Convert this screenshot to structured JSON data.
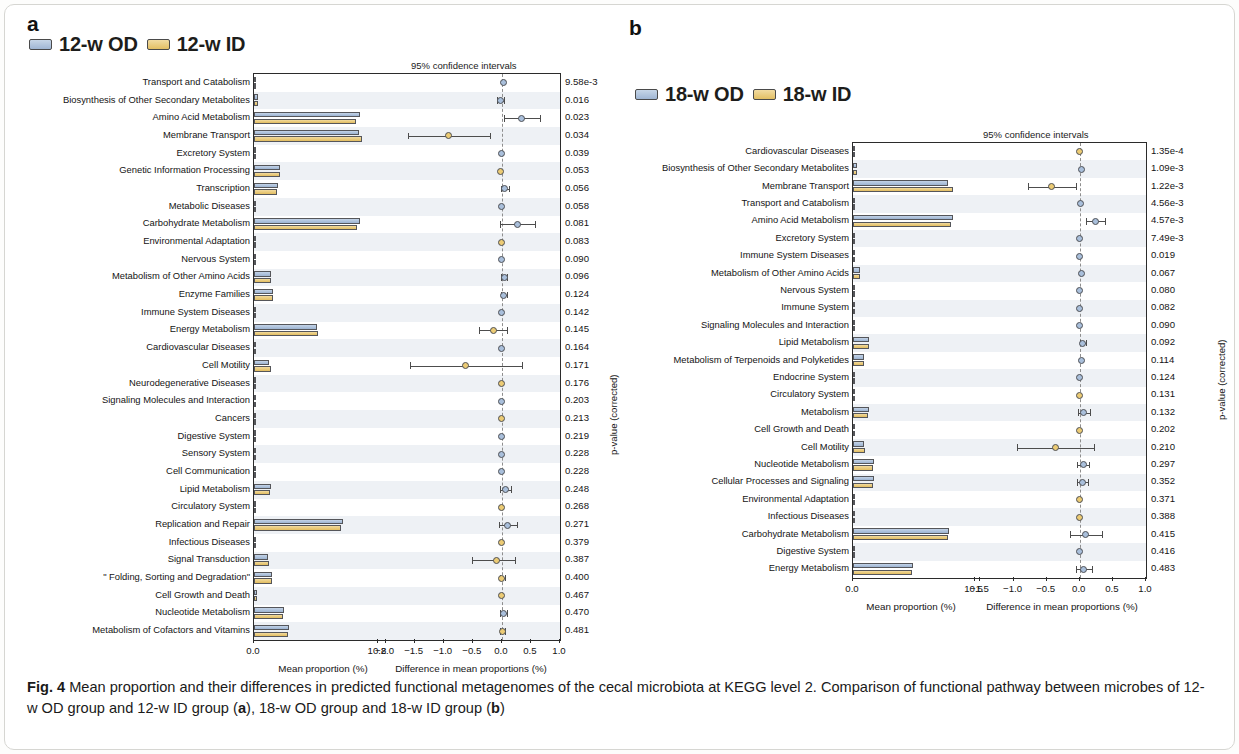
{
  "figure": {
    "caption_label": "Fig. 4",
    "caption_text": " Mean proportion and their differences in predicted functional metagenomes of the cecal microbiota at KEGG level 2. Comparison of functional pathway between microbes of 12-w OD group and 12-w ID group (",
    "caption_a": "a",
    "caption_mid": "), 18-w OD group and 18-w ID group (",
    "caption_b": "b",
    "caption_end": ")"
  },
  "colors": {
    "od_fill": "#a9bfdb",
    "id_fill": "#eccb74",
    "outline": "#4e5055",
    "band": "#eef1f5"
  },
  "panel_a": {
    "letter": "a",
    "legend": [
      {
        "name": "12-w OD",
        "color": "#a9bfdb"
      },
      {
        "name": "12-w ID",
        "color": "#eccb74"
      }
    ],
    "ci_title": "95% confidence intervals",
    "left_axis_title": "Mean proportion (%)",
    "right_axis_title": "Difference in mean proportions (%)",
    "pvalue_axis_title": "p-value (corrected)",
    "left_ticks": [
      "0.0",
      "10.8"
    ],
    "right_ticks": [
      "-2.0",
      "-1.5",
      "-1.0",
      "-0.5",
      "0.0",
      "0.5",
      "1.0"
    ]
  },
  "panel_b": {
    "letter": "b",
    "legend": [
      {
        "name": "18-w OD",
        "color": "#a9bfdb"
      },
      {
        "name": "18-w ID",
        "color": "#eccb74"
      }
    ],
    "ci_title": "95% confidence intervals",
    "left_axis_title": "Mean proportion (%)",
    "right_axis_title": "Difference in mean proportions (%)",
    "pvalue_axis_title": "p-value (corrected)",
    "left_ticks": [
      "0.0",
      "10.5"
    ],
    "right_ticks": [
      "-1.5",
      "-1.0",
      "-0.5",
      "0.0",
      "0.5",
      "1.0"
    ]
  },
  "chart_data": [
    {
      "type": "bar",
      "id": "panel_a",
      "title": "12-w OD vs 12-w ID",
      "subtitle": "95% confidence intervals",
      "xlabel": "Mean proportion (%)",
      "xlabel2": "Difference in mean proportions (%)",
      "ylabel": "",
      "rlabel": "p-value (corrected)",
      "xlim": [
        0,
        10.8
      ],
      "xlim2": [
        -2.0,
        1.0
      ],
      "grid": false,
      "legend": [
        "12-w OD",
        "12-w ID"
      ],
      "legend_position": "top-left",
      "categories": [
        "Transport and Catabolism",
        "Biosynthesis of Other Secondary Metabolites",
        "Amino Acid Metabolism",
        "Membrane Transport",
        "Excretory System",
        "Genetic Information Processing",
        "Transcription",
        "Metabolic Diseases",
        "Carbohydrate Metabolism",
        "Environmental Adaptation",
        "Nervous System",
        "Metabolism of Other Amino Acids",
        "Enzyme Families",
        "Immune System Diseases",
        "Energy Metabolism",
        "Cardiovascular Diseases",
        "Cell Motility",
        "Neurodegenerative Diseases",
        "Signaling Molecules and Interaction",
        "Cancers",
        "Digestive System",
        "Sensory System",
        "Cell Communication",
        "Lipid Metabolism",
        "Circulatory System",
        "Replication and Repair",
        "Infectious Diseases",
        "Signal Transduction",
        "\" Folding, Sorting and Degradation\"",
        "Cell Growth and Death",
        "Nucleotide Metabolism",
        "Metabolism of Cofactors and Vitamins"
      ],
      "series": [
        {
          "name": "12-w OD",
          "values": [
            0.14,
            0.32,
            9.22,
            9.12,
            0.03,
            2.28,
            2.06,
            0.02,
            9.25,
            0.05,
            0.03,
            1.52,
            1.64,
            0.02,
            5.45,
            0.02,
            1.28,
            0.04,
            0.03,
            0.02,
            0.03,
            0.01,
            0.02,
            1.44,
            0.02,
            7.72,
            0.16,
            1.18,
            1.6,
            0.24,
            2.6,
            3.02
          ]
        },
        {
          "name": "12-w ID",
          "values": [
            0.13,
            0.35,
            8.88,
            9.42,
            0.03,
            2.3,
            2.01,
            0.02,
            8.98,
            0.05,
            0.03,
            1.48,
            1.62,
            0.02,
            5.6,
            0.02,
            1.48,
            0.04,
            0.03,
            0.02,
            0.03,
            0.01,
            0.02,
            1.4,
            0.02,
            7.62,
            0.17,
            1.27,
            1.59,
            0.25,
            2.55,
            3.0
          ]
        }
      ],
      "effects": [
        {
          "diff": 0.02,
          "lo": -0.01,
          "hi": 0.05,
          "group": "od",
          "p": "9.58e-3"
        },
        {
          "diff": -0.03,
          "lo": -0.09,
          "hi": 0.03,
          "group": "od",
          "p": "0.016"
        },
        {
          "diff": 0.34,
          "lo": 0.04,
          "hi": 0.66,
          "group": "od",
          "p": "0.023"
        },
        {
          "diff": -0.92,
          "lo": -1.62,
          "hi": -0.2,
          "group": "id",
          "p": "0.034"
        },
        {
          "diff": 0.0,
          "lo": -0.01,
          "hi": 0.01,
          "group": "od",
          "p": "0.039"
        },
        {
          "diff": -0.02,
          "lo": -0.04,
          "hi": 0.01,
          "group": "id",
          "p": "0.053"
        },
        {
          "diff": 0.05,
          "lo": -0.02,
          "hi": 0.12,
          "group": "od",
          "p": "0.056"
        },
        {
          "diff": 0.0,
          "lo": -0.01,
          "hi": 0.01,
          "group": "od",
          "p": "0.058"
        },
        {
          "diff": 0.27,
          "lo": -0.03,
          "hi": 0.57,
          "group": "od",
          "p": "0.081"
        },
        {
          "diff": -0.01,
          "lo": -0.02,
          "hi": 0.01,
          "group": "id",
          "p": "0.083"
        },
        {
          "diff": 0.0,
          "lo": -0.01,
          "hi": 0.01,
          "group": "od",
          "p": "0.090"
        },
        {
          "diff": 0.04,
          "lo": -0.01,
          "hi": 0.09,
          "group": "od",
          "p": "0.096"
        },
        {
          "diff": 0.03,
          "lo": -0.02,
          "hi": 0.08,
          "group": "od",
          "p": "0.124"
        },
        {
          "diff": 0.0,
          "lo": -0.01,
          "hi": 0.01,
          "group": "od",
          "p": "0.142"
        },
        {
          "diff": -0.15,
          "lo": -0.4,
          "hi": 0.08,
          "group": "id",
          "p": "0.145"
        },
        {
          "diff": 0.0,
          "lo": -0.01,
          "hi": 0.01,
          "group": "od",
          "p": "0.164"
        },
        {
          "diff": -0.62,
          "lo": -1.58,
          "hi": 0.35,
          "group": "id",
          "p": "0.171"
        },
        {
          "diff": -0.01,
          "lo": -0.02,
          "hi": 0.0,
          "group": "id",
          "p": "0.176"
        },
        {
          "diff": 0.0,
          "lo": -0.01,
          "hi": 0.01,
          "group": "od",
          "p": "0.203"
        },
        {
          "diff": 0.0,
          "lo": -0.01,
          "hi": 0.01,
          "group": "id",
          "p": "0.213"
        },
        {
          "diff": 0.0,
          "lo": -0.01,
          "hi": 0.01,
          "group": "od",
          "p": "0.219"
        },
        {
          "diff": 0.0,
          "lo": -0.01,
          "hi": 0.01,
          "group": "od",
          "p": "0.228"
        },
        {
          "diff": 0.0,
          "lo": -0.01,
          "hi": 0.01,
          "group": "od",
          "p": "0.228"
        },
        {
          "diff": 0.06,
          "lo": -0.04,
          "hi": 0.16,
          "group": "od",
          "p": "0.248"
        },
        {
          "diff": 0.0,
          "lo": -0.01,
          "hi": 0.01,
          "group": "id",
          "p": "0.268"
        },
        {
          "diff": 0.1,
          "lo": -0.05,
          "hi": 0.26,
          "group": "od",
          "p": "0.271"
        },
        {
          "diff": 0.0,
          "lo": -0.01,
          "hi": 0.01,
          "group": "id",
          "p": "0.379"
        },
        {
          "diff": -0.1,
          "lo": -0.52,
          "hi": 0.22,
          "group": "id",
          "p": "0.387"
        },
        {
          "diff": 0.0,
          "lo": -0.04,
          "hi": 0.05,
          "group": "id",
          "p": "0.400"
        },
        {
          "diff": -0.01,
          "lo": -0.02,
          "hi": 0.01,
          "group": "id",
          "p": "0.467"
        },
        {
          "diff": 0.03,
          "lo": -0.03,
          "hi": 0.09,
          "group": "od",
          "p": "0.470"
        },
        {
          "diff": 0.01,
          "lo": -0.04,
          "hi": 0.06,
          "group": "id",
          "p": "0.481"
        }
      ]
    },
    {
      "type": "bar",
      "id": "panel_b",
      "title": "18-w OD vs 18-w ID",
      "subtitle": "95% confidence intervals",
      "xlabel": "Mean proportion (%)",
      "xlabel2": "Difference in mean proportions (%)",
      "ylabel": "",
      "rlabel": "p-value (corrected)",
      "xlim": [
        0,
        10.5
      ],
      "xlim2": [
        -1.5,
        1.0
      ],
      "grid": false,
      "legend": [
        "18-w OD",
        "18-w ID"
      ],
      "legend_position": "top-left",
      "categories": [
        "Cardiovascular Diseases",
        "Biosynthesis of Other Secondary Metabolites",
        "Membrane Transport",
        "Transport and Catabolism",
        "Amino Acid Metabolism",
        "Excretory System",
        "Immune System Diseases",
        "Metabolism of Other Amino Acids",
        "Nervous System",
        "Immune System",
        "Signaling Molecules and Interaction",
        "Lipid Metabolism",
        "Metabolism of Terpenoids and Polyketides",
        "Endocrine System",
        "Circulatory System",
        "Metabolism",
        "Cell Growth and Death",
        "Cell Motility",
        "Nucleotide Metabolism",
        "Cellular Processes and Signaling",
        "Environmental Adaptation",
        "Infectious Diseases",
        "Carbohydrate Metabolism",
        "Digestive System",
        "Energy Metabolism"
      ],
      "series": [
        {
          "name": "18-w OD",
          "values": [
            0.02,
            0.36,
            8.2,
            0.14,
            8.66,
            0.03,
            0.02,
            0.62,
            0.04,
            0.03,
            0.05,
            1.42,
            0.95,
            0.16,
            0.02,
            1.38,
            0.18,
            0.92,
            1.82,
            1.78,
            0.05,
            0.12,
            8.28,
            0.02,
            5.22
          ]
        },
        {
          "name": "18-w ID",
          "values": [
            0.02,
            0.38,
            8.6,
            0.13,
            8.42,
            0.03,
            0.02,
            0.6,
            0.04,
            0.03,
            0.05,
            1.38,
            0.92,
            0.16,
            0.02,
            1.32,
            0.19,
            1.05,
            1.76,
            1.74,
            0.05,
            0.13,
            8.18,
            0.02,
            5.1
          ]
        }
      ],
      "effects": [
        {
          "diff": 0.0,
          "lo": -0.01,
          "hi": 0.01,
          "group": "id",
          "p": "1.35e-4"
        },
        {
          "diff": 0.02,
          "lo": -0.01,
          "hi": 0.05,
          "group": "od",
          "p": "1.09e-3"
        },
        {
          "diff": -0.42,
          "lo": -0.78,
          "hi": -0.06,
          "group": "id",
          "p": "1.22e-3"
        },
        {
          "diff": 0.01,
          "lo": -0.01,
          "hi": 0.03,
          "group": "od",
          "p": "4.56e-3"
        },
        {
          "diff": 0.24,
          "lo": 0.1,
          "hi": 0.38,
          "group": "od",
          "p": "4.57e-3"
        },
        {
          "diff": 0.0,
          "lo": -0.01,
          "hi": 0.01,
          "group": "od",
          "p": "7.49e-3"
        },
        {
          "diff": 0.0,
          "lo": -0.01,
          "hi": 0.01,
          "group": "od",
          "p": "0.019"
        },
        {
          "diff": 0.02,
          "lo": -0.01,
          "hi": 0.05,
          "group": "od",
          "p": "0.067"
        },
        {
          "diff": 0.0,
          "lo": -0.01,
          "hi": 0.01,
          "group": "od",
          "p": "0.080"
        },
        {
          "diff": 0.0,
          "lo": -0.01,
          "hi": 0.01,
          "group": "od",
          "p": "0.082"
        },
        {
          "diff": 0.0,
          "lo": -0.01,
          "hi": 0.01,
          "group": "od",
          "p": "0.090"
        },
        {
          "diff": 0.04,
          "lo": 0.0,
          "hi": 0.09,
          "group": "od",
          "p": "0.092"
        },
        {
          "diff": 0.03,
          "lo": -0.01,
          "hi": 0.06,
          "group": "od",
          "p": "0.114"
        },
        {
          "diff": 0.0,
          "lo": -0.01,
          "hi": 0.02,
          "group": "od",
          "p": "0.124"
        },
        {
          "diff": 0.0,
          "lo": -0.01,
          "hi": 0.01,
          "group": "id",
          "p": "0.131"
        },
        {
          "diff": 0.06,
          "lo": -0.02,
          "hi": 0.15,
          "group": "od",
          "p": "0.132"
        },
        {
          "diff": -0.01,
          "lo": -0.02,
          "hi": 0.01,
          "group": "id",
          "p": "0.202"
        },
        {
          "diff": -0.36,
          "lo": -0.95,
          "hi": 0.22,
          "group": "id",
          "p": "0.210"
        },
        {
          "diff": 0.05,
          "lo": -0.04,
          "hi": 0.14,
          "group": "od",
          "p": "0.297"
        },
        {
          "diff": 0.04,
          "lo": -0.04,
          "hi": 0.12,
          "group": "od",
          "p": "0.352"
        },
        {
          "diff": 0.0,
          "lo": -0.01,
          "hi": 0.01,
          "group": "id",
          "p": "0.371"
        },
        {
          "diff": 0.0,
          "lo": -0.01,
          "hi": 0.01,
          "group": "id",
          "p": "0.388"
        },
        {
          "diff": 0.09,
          "lo": -0.15,
          "hi": 0.34,
          "group": "od",
          "p": "0.415"
        },
        {
          "diff": 0.0,
          "lo": -0.01,
          "hi": 0.01,
          "group": "od",
          "p": "0.416"
        },
        {
          "diff": 0.06,
          "lo": -0.06,
          "hi": 0.18,
          "group": "od",
          "p": "0.483"
        }
      ]
    }
  ]
}
